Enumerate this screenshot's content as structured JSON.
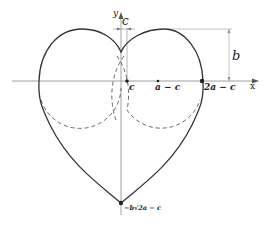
{
  "diagram": {
    "axes": {
      "x_label": "x",
      "y_label": "y"
    },
    "dimension_labels": {
      "c_width": "c",
      "b_height": "b"
    },
    "points": [
      {
        "name": "c",
        "label": "c"
      },
      {
        "name": "a-c",
        "label": "a − c"
      },
      {
        "name": "2a-c",
        "label": "2a − c"
      },
      {
        "name": "bottom",
        "label": "−b√2a − c"
      }
    ],
    "colors": {
      "curve": "#333333",
      "axis": "#888888",
      "dashed": "#555555",
      "dimension": "#999999"
    }
  }
}
